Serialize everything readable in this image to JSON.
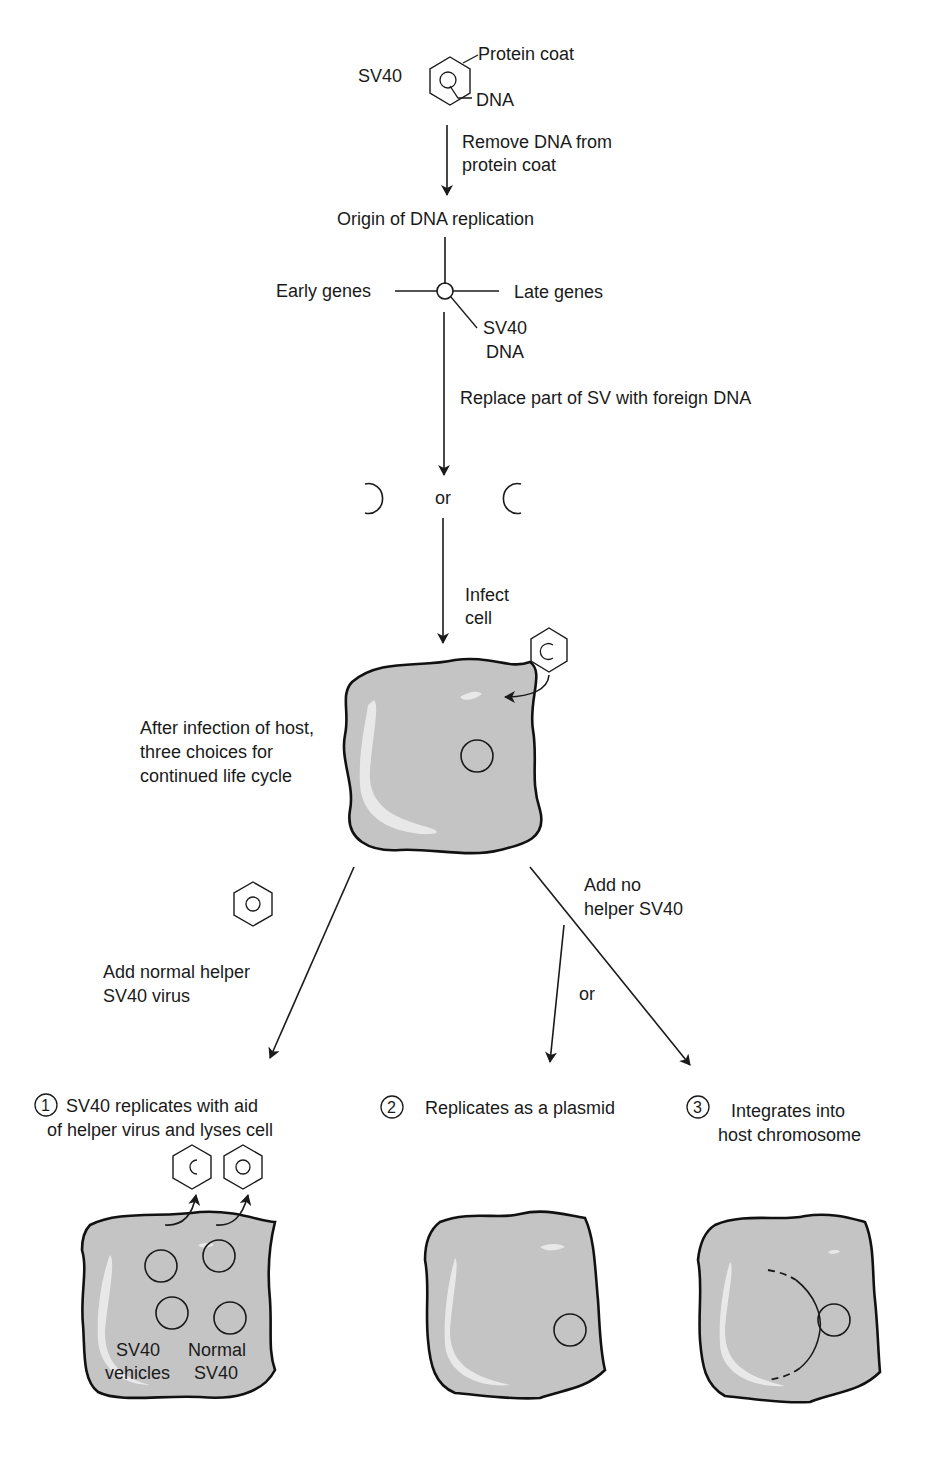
{
  "top": {
    "sv40_label": "SV40",
    "protein_coat_label": "Protein coat",
    "dna_label": "DNA"
  },
  "steps": {
    "remove_dna_line1": "Remove DNA from",
    "remove_dna_line2": "protein coat",
    "origin_label": "Origin of DNA replication",
    "early_genes": "Early genes",
    "late_genes": "Late genes",
    "sv40_dna_line1": "SV40",
    "sv40_dna_line2": "DNA",
    "replace_label": "Replace part of SV with foreign DNA",
    "or_label": "or",
    "infect_line1": "Infect",
    "infect_line2": "cell"
  },
  "host": {
    "caption_line1": "After infection of host,",
    "caption_line2": "three choices for",
    "caption_line3": "continued life cycle"
  },
  "branches": {
    "helper_line1": "Add normal helper",
    "helper_line2": "SV40 virus",
    "no_helper_line1": "Add no",
    "no_helper_line2": "helper SV40",
    "or_label": "or"
  },
  "outcomes": [
    {
      "number": "1",
      "line1": "SV40 replicates with aid",
      "line2": "of helper virus and lyses cell",
      "inner_label_left_1": "SV40",
      "inner_label_left_2": "vehicles",
      "inner_label_right_1": "Normal",
      "inner_label_right_2": "SV40"
    },
    {
      "number": "2",
      "line1": "Replicates as a plasmid"
    },
    {
      "number": "3",
      "line1": "Integrates into",
      "line2": "host chromosome"
    }
  ],
  "colors": {
    "cell_fill": "#c4c4c4",
    "stroke": "#1a1a1a"
  }
}
